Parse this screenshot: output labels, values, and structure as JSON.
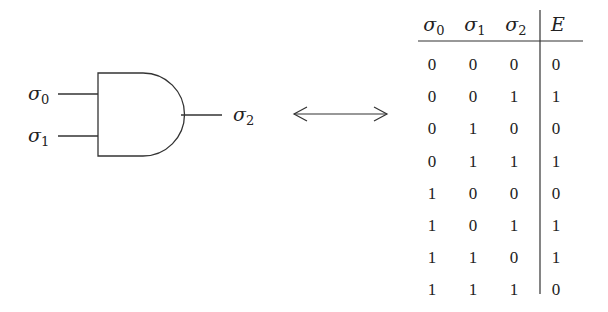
{
  "gate": {
    "type": "AND",
    "inputs": [
      {
        "symbol": "σ",
        "sub": "0"
      },
      {
        "symbol": "σ",
        "sub": "1"
      }
    ],
    "output": {
      "symbol": "σ",
      "sub": "2"
    }
  },
  "arrow": {
    "type": "double-headed"
  },
  "table": {
    "headers": [
      {
        "symbol": "σ",
        "sub": "0"
      },
      {
        "symbol": "σ",
        "sub": "1"
      },
      {
        "symbol": "σ",
        "sub": "2"
      },
      {
        "symbol": "E",
        "sub": ""
      }
    ],
    "rows": [
      [
        "0",
        "0",
        "0",
        "0"
      ],
      [
        "0",
        "0",
        "1",
        "1"
      ],
      [
        "0",
        "1",
        "0",
        "0"
      ],
      [
        "0",
        "1",
        "1",
        "1"
      ],
      [
        "1",
        "0",
        "0",
        "0"
      ],
      [
        "1",
        "0",
        "1",
        "1"
      ],
      [
        "1",
        "1",
        "0",
        "1"
      ],
      [
        "1",
        "1",
        "1",
        "0"
      ]
    ]
  }
}
